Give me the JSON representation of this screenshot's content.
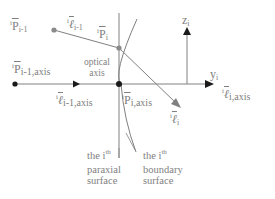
{
  "diagram": {
    "labels": {
      "p_prev": {
        "pre": "i",
        "sym": "P",
        "sub": "i-1"
      },
      "l_prev": {
        "pre": "i",
        "sym": "ℓ",
        "sub": "i-1"
      },
      "p_i": {
        "pre": "i",
        "sym": "P",
        "sub": "i"
      },
      "z_axis": {
        "sym": "z",
        "sub": "i"
      },
      "p_prev_axis": {
        "pre": "i",
        "sym": "P",
        "sub": "i-1,axis"
      },
      "optical_axis": "optical axis",
      "y_axis": {
        "sym": "y",
        "sub": "i"
      },
      "l_prev_axis": {
        "pre": "i",
        "sym": "ℓ",
        "sub": "i-1,axis"
      },
      "p_i_axis": {
        "pre": "i",
        "sym": "P",
        "sub": "i,axis"
      },
      "l_i": {
        "pre": "i",
        "sym": "ℓ",
        "sub": "i"
      },
      "l_i_axis": {
        "pre": "i",
        "sym": "ℓ",
        "sub": "i,axis"
      },
      "paraxial_surface": {
        "line1": "the i",
        "sup": "th",
        "line2": "paraxial",
        "line3": "surface"
      },
      "boundary_surface": {
        "line1": "the i",
        "sup": "th",
        "line2": "boundary",
        "line3": "surface"
      }
    },
    "colors": {
      "line": "#808080",
      "dot_black": "#1a1a1a",
      "dot_gray": "#8a8a8a",
      "arrow": "#1a1a1a"
    }
  }
}
